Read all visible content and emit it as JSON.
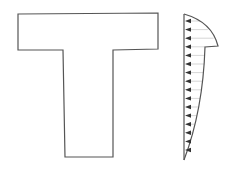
{
  "diagram": {
    "section": {
      "shape": "T-beam",
      "stroke": "#555555"
    },
    "stress_distribution": {
      "arrow_count": 16,
      "arrow_direction": "left",
      "stroke": "#555555",
      "arrow_color": "#333333",
      "hatch_color": "#bbbbbb"
    }
  }
}
